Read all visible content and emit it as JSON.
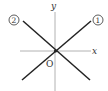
{
  "diagram": {
    "type": "coordinate-axes-with-lines",
    "axes": {
      "x_label": "x",
      "y_label": "y",
      "origin_label": "O"
    },
    "lines": [
      {
        "id": "line-1",
        "label": "①",
        "direction": "positive slope (lower-left to upper-right)"
      },
      {
        "id": "line-2",
        "label": "②",
        "direction": "negative slope (upper-left to lower-right)"
      }
    ],
    "colors": {
      "axis": "#9a9a9a",
      "line": "#222222",
      "text": "#333333",
      "background": "#ffffff"
    }
  }
}
